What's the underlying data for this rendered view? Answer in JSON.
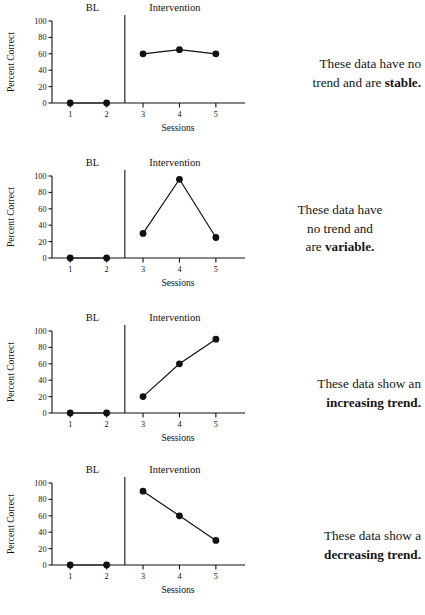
{
  "figure": {
    "background": "#ffffff",
    "ink": "#111111"
  },
  "axis_labels": {
    "y": "Percent Correct",
    "x": "Sessions"
  },
  "phase_labels": {
    "baseline": "BL",
    "intervention": "Intervention"
  },
  "panels": [
    {
      "id": "panel-stable",
      "caption_plain": "These data have no trend and are stable.",
      "caption_lines": [
        "These data have no",
        "trend and are "
      ],
      "caption_bold": "stable.",
      "caption_align": "right",
      "chart_data": {
        "type": "line",
        "title": "",
        "xlabel": "Sessions",
        "ylabel": "Percent Correct",
        "xlim": [
          0.5,
          5.8
        ],
        "ylim": [
          0,
          100
        ],
        "yticks": [
          0,
          20,
          40,
          60,
          80,
          100
        ],
        "xticks": [
          1,
          2,
          3,
          4,
          5
        ],
        "grid": false,
        "legend": "none",
        "phase_change_x": 2.5,
        "series": [
          {
            "name": "Baseline",
            "x": [
              1,
              2
            ],
            "values": [
              0,
              0
            ]
          },
          {
            "name": "Intervention",
            "x": [
              3,
              4,
              5
            ],
            "values": [
              60,
              65,
              60
            ]
          }
        ]
      }
    },
    {
      "id": "panel-variable",
      "caption_plain": "These data have no trend and are variable.",
      "caption_lines": [
        "These data have",
        "no trend and",
        "are "
      ],
      "caption_bold": "variable.",
      "caption_align": "center",
      "chart_data": {
        "type": "line",
        "title": "",
        "xlabel": "Sessions",
        "ylabel": "Percent Correct",
        "xlim": [
          0.5,
          5.8
        ],
        "ylim": [
          0,
          100
        ],
        "yticks": [
          0,
          20,
          40,
          60,
          80,
          100
        ],
        "xticks": [
          1,
          2,
          3,
          4,
          5
        ],
        "grid": false,
        "legend": "none",
        "phase_change_x": 2.5,
        "series": [
          {
            "name": "Baseline",
            "x": [
              1,
              2
            ],
            "values": [
              0,
              0
            ]
          },
          {
            "name": "Intervention",
            "x": [
              3,
              4,
              5
            ],
            "values": [
              30,
              96,
              25
            ]
          }
        ]
      }
    },
    {
      "id": "panel-increasing",
      "caption_plain": "These data show an increasing trend.",
      "caption_lines": [
        "These data show an",
        ""
      ],
      "caption_bold": "increasing trend.",
      "caption_align": "right",
      "chart_data": {
        "type": "line",
        "title": "",
        "xlabel": "Sessions",
        "ylabel": "Percent Correct",
        "xlim": [
          0.5,
          5.8
        ],
        "ylim": [
          0,
          100
        ],
        "yticks": [
          0,
          20,
          40,
          60,
          80,
          100
        ],
        "xticks": [
          1,
          2,
          3,
          4,
          5
        ],
        "grid": false,
        "legend": "none",
        "phase_change_x": 2.5,
        "series": [
          {
            "name": "Baseline",
            "x": [
              1,
              2
            ],
            "values": [
              0,
              0
            ]
          },
          {
            "name": "Intervention",
            "x": [
              3,
              4,
              5
            ],
            "values": [
              20,
              60,
              90
            ]
          }
        ]
      }
    },
    {
      "id": "panel-decreasing",
      "caption_plain": "These data show a decreasing trend.",
      "caption_lines": [
        "These data show a",
        ""
      ],
      "caption_bold": "decreasing trend.",
      "caption_align": "right",
      "chart_data": {
        "type": "line",
        "title": "",
        "xlabel": "Sessions",
        "ylabel": "Percent Correct",
        "xlim": [
          0.5,
          5.8
        ],
        "ylim": [
          0,
          100
        ],
        "yticks": [
          0,
          20,
          40,
          60,
          80,
          100
        ],
        "xticks": [
          1,
          2,
          3,
          4,
          5
        ],
        "grid": false,
        "legend": "none",
        "phase_change_x": 2.5,
        "series": [
          {
            "name": "Baseline",
            "x": [
              1,
              2
            ],
            "values": [
              0,
              0
            ]
          },
          {
            "name": "Intervention",
            "x": [
              3,
              4,
              5
            ],
            "values": [
              90,
              60,
              30
            ]
          }
        ]
      }
    }
  ]
}
